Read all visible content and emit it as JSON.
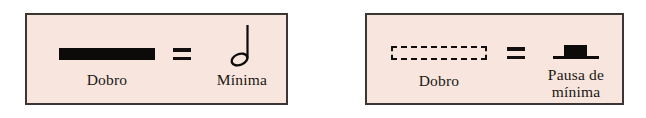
{
  "figure": {
    "background_color": "#ffffff",
    "panel_fill_color": "#f8e6de",
    "panel_border_color": "#3b3533",
    "ink_color": "#0d0b0a"
  },
  "panels": [
    {
      "id": "panel-left",
      "equals_label": "=",
      "left_item": {
        "symbol": "solid-duration-bar",
        "caption": "Dobro"
      },
      "right_item": {
        "symbol": "half-note",
        "caption": "Mínima"
      }
    },
    {
      "id": "panel-right",
      "equals_label": "=",
      "left_item": {
        "symbol": "dashed-duration-bar",
        "caption": "Dobro"
      },
      "right_item": {
        "symbol": "half-rest",
        "caption_line1": "Pausa de",
        "caption_line2": "mínima"
      }
    }
  ]
}
